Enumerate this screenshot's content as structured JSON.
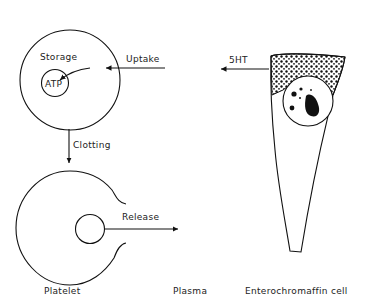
{
  "diagram": {
    "labels": {
      "storage": "Storage",
      "atp": "ATP",
      "uptake": "Uptake",
      "five_ht": "5HT",
      "clotting": "Clotting",
      "release": "Release",
      "platelet": "Platelet",
      "plasma": "Plasma",
      "enterochromaffin_cell": "Enterochromaffin cell"
    },
    "flows": [
      {
        "from": "Enterochromaffin cell",
        "to": "Plasma",
        "label": "5HT"
      },
      {
        "from": "Plasma",
        "to": "Platelet",
        "label": "Uptake"
      },
      {
        "from": "Storage",
        "to": "ATP",
        "label": ""
      },
      {
        "from": "Platelet",
        "to": "Platelet (activated)",
        "label": "Clotting"
      },
      {
        "from": "Platelet (activated)",
        "to": "Plasma",
        "label": "Release"
      }
    ],
    "colors": {
      "line": "#111111",
      "background": "#ffffff"
    }
  }
}
